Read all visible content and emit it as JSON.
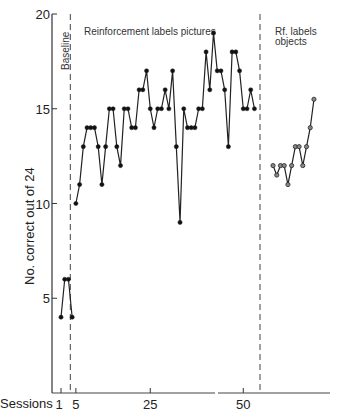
{
  "chart_data": {
    "type": "line",
    "title": "",
    "xlabel": "Sessions",
    "ylabel": "No. correct out of 24",
    "ylim": [
      0,
      20
    ],
    "xlim": [
      0,
      72
    ],
    "grid": false,
    "legend": null,
    "x_ticks": [
      1,
      5,
      25,
      50
    ],
    "x_tick_labels": [
      "1",
      "5",
      "25",
      "50"
    ],
    "y_ticks": [
      5,
      10,
      15,
      20
    ],
    "y_tick_labels": [
      "5",
      "10",
      "15",
      "20"
    ],
    "phase_dividers": [
      3.5,
      54.5
    ],
    "phases": [
      {
        "label": "Baseline",
        "orientation": "vertical"
      },
      {
        "label": "Reinforcement labels pictures",
        "orientation": "horizontal"
      },
      {
        "label_lines": [
          "Rf. labels",
          "objects"
        ],
        "orientation": "horizontal"
      }
    ],
    "series": [
      {
        "name": "Baseline",
        "marker": "filled",
        "x": [
          0,
          1,
          2,
          3
        ],
        "values": [
          4,
          6,
          6,
          4
        ]
      },
      {
        "name": "Reinforcement labels pictures",
        "marker": "filled",
        "x": [
          4,
          5,
          6,
          7,
          8,
          9,
          10,
          11,
          12,
          13,
          14,
          15,
          16,
          17,
          18,
          19,
          20,
          21,
          22,
          23,
          24,
          25,
          26,
          27,
          28,
          29,
          30,
          31,
          32,
          33,
          34,
          35,
          36,
          37,
          38,
          39,
          40,
          41,
          42,
          43,
          44,
          45,
          46,
          47,
          48,
          49,
          50,
          51,
          52
        ],
        "values": [
          10,
          11,
          13,
          14,
          14,
          14,
          13,
          11,
          13,
          15,
          15,
          13,
          12,
          15,
          15,
          14,
          14,
          16,
          16,
          17,
          15,
          14,
          15,
          15,
          16,
          15,
          17,
          13,
          9,
          15,
          14,
          14,
          14,
          15,
          15,
          18,
          16,
          19,
          17,
          17,
          16,
          13,
          18,
          18,
          17,
          15,
          15,
          16,
          15
        ]
      },
      {
        "name": "Rf. labels objects",
        "marker": "open",
        "x": [
          57,
          58,
          59,
          60,
          61,
          62,
          63,
          64,
          65,
          66,
          67,
          68
        ],
        "values": [
          12,
          11.5,
          12,
          12,
          11,
          12,
          13,
          13,
          12,
          13,
          14,
          15.5
        ]
      }
    ]
  },
  "axis": {
    "x_title": "Sessions",
    "y_title": "No. correct out of 24"
  }
}
